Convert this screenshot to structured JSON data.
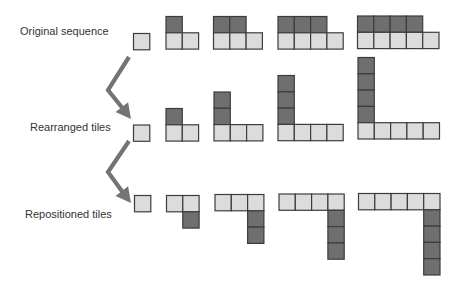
{
  "colors": {
    "light_tile": "#dcdcdc",
    "dark_tile": "#6f6f6f",
    "tile_border": "#3c3c3c",
    "arrow": "#747474",
    "text": "#333333"
  },
  "tile_size": 16.3,
  "labels": {
    "row1": "Original sequence",
    "row2": "Rearranged tiles",
    "row3": "Repositioned tiles"
  },
  "rows": [
    {
      "name": "original-sequence",
      "groups": [
        {
          "x": 133.5,
          "y": 33.5,
          "tiles": [
            [
              0,
              0,
              "light"
            ]
          ]
        },
        {
          "x": 166,
          "y": 16.5,
          "tiles": [
            [
              0,
              0,
              "dark"
            ],
            [
              0,
              1,
              "light"
            ],
            [
              1,
              1,
              "light"
            ]
          ]
        },
        {
          "x": 213.5,
          "y": 16.5,
          "tiles": [
            [
              0,
              0,
              "dark"
            ],
            [
              1,
              0,
              "dark"
            ],
            [
              0,
              1,
              "light"
            ],
            [
              1,
              1,
              "light"
            ],
            [
              2,
              1,
              "light"
            ]
          ]
        },
        {
          "x": 278,
          "y": 16.5,
          "tiles": [
            [
              0,
              0,
              "dark"
            ],
            [
              1,
              0,
              "dark"
            ],
            [
              2,
              0,
              "dark"
            ],
            [
              0,
              1,
              "light"
            ],
            [
              1,
              1,
              "light"
            ],
            [
              2,
              1,
              "light"
            ],
            [
              3,
              1,
              "light"
            ]
          ]
        },
        {
          "x": 357.5,
          "y": 16,
          "tiles": [
            [
              0,
              0,
              "dark"
            ],
            [
              1,
              0,
              "dark"
            ],
            [
              2,
              0,
              "dark"
            ],
            [
              3,
              0,
              "dark"
            ],
            [
              0,
              1,
              "light"
            ],
            [
              1,
              1,
              "light"
            ],
            [
              2,
              1,
              "light"
            ],
            [
              3,
              1,
              "light"
            ],
            [
              4,
              1,
              "light"
            ]
          ]
        }
      ]
    },
    {
      "name": "rearranged-tiles",
      "groups": [
        {
          "x": 133.5,
          "y": 125,
          "tiles": [
            [
              0,
              0,
              "light"
            ]
          ]
        },
        {
          "x": 166,
          "y": 108.5,
          "tiles": [
            [
              0,
              0,
              "dark"
            ],
            [
              0,
              1,
              "light"
            ],
            [
              1,
              1,
              "light"
            ]
          ]
        },
        {
          "x": 214,
          "y": 92,
          "tiles": [
            [
              0,
              0,
              "dark"
            ],
            [
              0,
              1,
              "dark"
            ],
            [
              0,
              2,
              "light"
            ],
            [
              1,
              2,
              "light"
            ],
            [
              2,
              2,
              "light"
            ]
          ]
        },
        {
          "x": 278,
          "y": 75.5,
          "tiles": [
            [
              0,
              0,
              "dark"
            ],
            [
              0,
              1,
              "dark"
            ],
            [
              0,
              2,
              "dark"
            ],
            [
              0,
              3,
              "light"
            ],
            [
              1,
              3,
              "light"
            ],
            [
              2,
              3,
              "light"
            ],
            [
              3,
              3,
              "light"
            ]
          ]
        },
        {
          "x": 358,
          "y": 57.5,
          "tiles": [
            [
              0,
              0,
              "dark"
            ],
            [
              0,
              1,
              "dark"
            ],
            [
              0,
              2,
              "dark"
            ],
            [
              0,
              3,
              "dark"
            ],
            [
              0,
              4,
              "light"
            ],
            [
              1,
              4,
              "light"
            ],
            [
              2,
              4,
              "light"
            ],
            [
              3,
              4,
              "light"
            ],
            [
              4,
              4,
              "light"
            ]
          ]
        }
      ]
    },
    {
      "name": "repositioned-tiles",
      "groups": [
        {
          "x": 134.5,
          "y": 195.5,
          "tiles": [
            [
              0,
              0,
              "light"
            ]
          ]
        },
        {
          "x": 166.5,
          "y": 195.5,
          "tiles": [
            [
              0,
              0,
              "light"
            ],
            [
              1,
              0,
              "light"
            ],
            [
              1,
              1,
              "dark"
            ]
          ]
        },
        {
          "x": 215,
          "y": 194.5,
          "tiles": [
            [
              0,
              0,
              "light"
            ],
            [
              1,
              0,
              "light"
            ],
            [
              2,
              0,
              "light"
            ],
            [
              2,
              1,
              "dark"
            ],
            [
              2,
              2,
              "dark"
            ]
          ]
        },
        {
          "x": 279,
          "y": 194,
          "tiles": [
            [
              0,
              0,
              "light"
            ],
            [
              1,
              0,
              "light"
            ],
            [
              2,
              0,
              "light"
            ],
            [
              3,
              0,
              "light"
            ],
            [
              3,
              1,
              "dark"
            ],
            [
              3,
              2,
              "dark"
            ],
            [
              3,
              3,
              "dark"
            ]
          ]
        },
        {
          "x": 358.5,
          "y": 193.5,
          "tiles": [
            [
              0,
              0,
              "light"
            ],
            [
              1,
              0,
              "light"
            ],
            [
              2,
              0,
              "light"
            ],
            [
              3,
              0,
              "light"
            ],
            [
              4,
              0,
              "light"
            ],
            [
              4,
              1,
              "dark"
            ],
            [
              4,
              2,
              "dark"
            ],
            [
              4,
              3,
              "dark"
            ],
            [
              4,
              4,
              "dark"
            ]
          ]
        }
      ]
    }
  ],
  "arrows": [
    {
      "name": "arrow-original-to-rearranged",
      "points": [
        [
          129,
          57
        ],
        [
          108,
          90
        ],
        [
          124,
          110
        ]
      ],
      "tip": [
        131,
        119
      ]
    },
    {
      "name": "arrow-rearranged-to-repositioned",
      "points": [
        [
          129,
          141
        ],
        [
          108,
          172
        ],
        [
          124,
          194
        ]
      ],
      "tip": [
        131,
        203
      ]
    }
  ]
}
